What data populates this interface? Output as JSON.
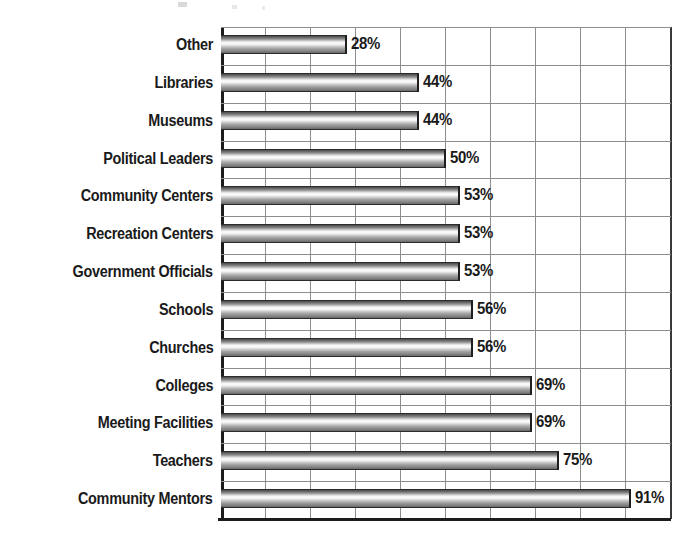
{
  "chart_data": {
    "type": "bar",
    "orientation": "horizontal",
    "title": "",
    "xlabel": "",
    "ylabel": "",
    "xlim": [
      0,
      100
    ],
    "xtick_interval": 10,
    "grid": true,
    "grid_axis": "x",
    "legend": false,
    "value_suffix": "%",
    "categories": [
      "Other",
      "Libraries",
      "Museums",
      "Political Leaders",
      "Community Centers",
      "Recreation Centers",
      "Government Officials",
      "Schools",
      "Churches",
      "Colleges",
      "Meeting Facilities",
      "Teachers",
      "Community Mentors"
    ],
    "values": [
      28,
      44,
      44,
      50,
      53,
      53,
      53,
      56,
      56,
      69,
      69,
      75,
      91
    ],
    "labels": [
      "28%",
      "44%",
      "44%",
      "50%",
      "53%",
      "53%",
      "53%",
      "56%",
      "56%",
      "69%",
      "69%",
      "75%",
      "91%"
    ],
    "bars": [
      {
        "category": "Other",
        "value": 28,
        "label": "28%"
      },
      {
        "category": "Libraries",
        "value": 44,
        "label": "44%"
      },
      {
        "category": "Museums",
        "value": 44,
        "label": "44%"
      },
      {
        "category": "Political Leaders",
        "value": 50,
        "label": "50%"
      },
      {
        "category": "Community Centers",
        "value": 53,
        "label": "53%"
      },
      {
        "category": "Recreation Centers",
        "value": 53,
        "label": "53%"
      },
      {
        "category": "Government Officials",
        "value": 53,
        "label": "53%"
      },
      {
        "category": "Schools",
        "value": 56,
        "label": "56%"
      },
      {
        "category": "Churches",
        "value": 56,
        "label": "56%"
      },
      {
        "category": "Colleges",
        "value": 69,
        "label": "69%"
      },
      {
        "category": "Meeting Facilities",
        "value": 69,
        "label": "69%"
      },
      {
        "category": "Teachers",
        "value": 75,
        "label": "75%"
      },
      {
        "category": "Community Mentors",
        "value": 91,
        "label": "91%"
      }
    ],
    "colors": {
      "bar_dark": "#4a4a4a",
      "bar_highlight": "#fdfdfd",
      "bar_outline": "#1e1e1e",
      "gridline": "#8d8d8d",
      "axis": "#1c1c1c",
      "text": "#1a1a1a",
      "background": "#ffffff"
    }
  }
}
